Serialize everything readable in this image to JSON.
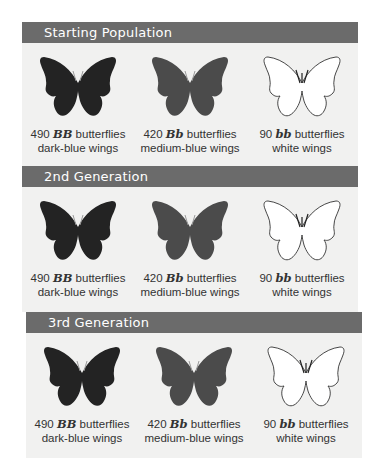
{
  "colors": {
    "header_bg": "#6b6b6b",
    "panel_bg": "#f1f1f0",
    "dark_blue_wing": "#232323",
    "medium_blue_wing": "#4b4b4b",
    "white_wing": "#ffffff"
  },
  "sections": [
    {
      "title": "Starting Population",
      "groups": [
        {
          "count": "490",
          "genotype": "BB",
          "suffix": "butterflies",
          "phenotype": "dark-blue wings",
          "icon": "butterfly-dark-icon"
        },
        {
          "count": "420",
          "genotype": "Bb",
          "suffix": "butterflies",
          "phenotype": "medium-blue wings",
          "icon": "butterfly-medium-icon"
        },
        {
          "count": "90",
          "genotype": "bb",
          "suffix": "butterflies",
          "phenotype": "white wings",
          "icon": "butterfly-white-icon"
        }
      ]
    },
    {
      "title": "2nd Generation",
      "groups": [
        {
          "count": "490",
          "genotype": "BB",
          "suffix": "butterflies",
          "phenotype": "dark-blue wings",
          "icon": "butterfly-dark-icon"
        },
        {
          "count": "420",
          "genotype": "Bb",
          "suffix": "butterflies",
          "phenotype": "medium-blue wings",
          "icon": "butterfly-medium-icon"
        },
        {
          "count": "90",
          "genotype": "bb",
          "suffix": "butterflies",
          "phenotype": "white wings",
          "icon": "butterfly-white-icon"
        }
      ]
    },
    {
      "title": "3rd Generation",
      "groups": [
        {
          "count": "490",
          "genotype": "BB",
          "suffix": "butterflies",
          "phenotype": "dark-blue wings",
          "icon": "butterfly-dark-icon"
        },
        {
          "count": "420",
          "genotype": "Bb",
          "suffix": "butterflies",
          "phenotype": "medium-blue wings",
          "icon": "butterfly-medium-icon"
        },
        {
          "count": "90",
          "genotype": "bb",
          "suffix": "butterflies",
          "phenotype": "white wings",
          "icon": "butterfly-white-icon"
        }
      ]
    }
  ]
}
